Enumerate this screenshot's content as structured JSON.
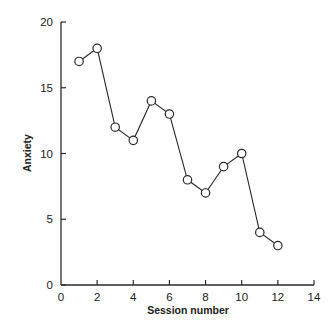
{
  "chart_data": {
    "type": "line",
    "title": "",
    "xlabel": "Session number",
    "ylabel": "Anxiety",
    "xlim": [
      0,
      14
    ],
    "ylim": [
      0,
      20
    ],
    "xticks": [
      0,
      2,
      4,
      6,
      8,
      10,
      12,
      14
    ],
    "yticks": [
      0,
      5,
      10,
      15,
      20
    ],
    "grid": false,
    "legend": null,
    "marker": "open-circle",
    "series": [
      {
        "name": "Anxiety",
        "x": [
          1,
          2,
          3,
          4,
          5,
          6,
          7,
          8,
          9,
          10,
          11,
          12
        ],
        "values": [
          17,
          18,
          12,
          11,
          14,
          13,
          8,
          7,
          9,
          10,
          4,
          3
        ]
      }
    ]
  },
  "colors": {
    "ink": "#2a2a2a",
    "background": "#ffffff",
    "marker_fill": "#ffffff"
  }
}
